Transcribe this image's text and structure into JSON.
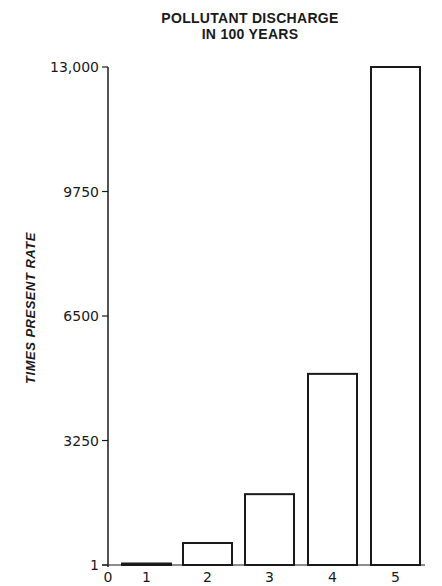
{
  "chart_data": {
    "type": "bar",
    "title": "POLLUTANT DISCHARGE IN 100 YEARS",
    "title_lines": [
      "POLLUTANT DISCHARGE",
      "IN 100 YEARS"
    ],
    "xlabel": "",
    "ylabel": "TIMES PRESENT RATE",
    "categories": [
      "1",
      "2",
      "3",
      "4",
      "5"
    ],
    "values": [
      1,
      575,
      1850,
      4990,
      13000
    ],
    "x_ticks": [
      "0",
      "1",
      "2",
      "3",
      "4",
      "5"
    ],
    "y_ticks": [
      {
        "value": 1,
        "label": "1"
      },
      {
        "value": 3250,
        "label": "3250"
      },
      {
        "value": 6500,
        "label": "6500"
      },
      {
        "value": 9750,
        "label": "9750"
      },
      {
        "value": 13000,
        "label": "13,000"
      }
    ],
    "ylim": [
      1,
      13000
    ],
    "grid": false,
    "legend": null,
    "bar_fill": "#ffffff",
    "bar_stroke": "#1a1a1a"
  }
}
